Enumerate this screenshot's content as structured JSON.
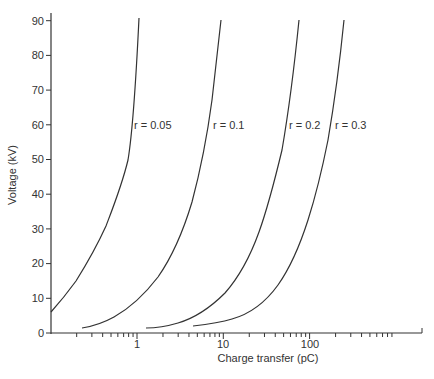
{
  "chart_data": {
    "type": "line",
    "title": "",
    "xlabel": "Charge transfer (pC)",
    "ylabel": "Voltage (kV)",
    "xscale": "log",
    "xlim": [
      0.1,
      2000
    ],
    "ylim": [
      0,
      90
    ],
    "x_tick_labels": [
      "1",
      "10",
      "100"
    ],
    "y_tick_labels": [
      "0",
      "10",
      "20",
      "30",
      "40",
      "50",
      "60",
      "70",
      "80",
      "90"
    ],
    "grid": false,
    "legend": "inline labels",
    "series": [
      {
        "name": "r = 0.05",
        "points": [
          [
            0.1,
            6
          ],
          [
            0.17,
            12
          ],
          [
            0.31,
            22
          ],
          [
            0.5,
            35
          ],
          [
            0.72,
            47
          ],
          [
            0.86,
            60
          ],
          [
            1.02,
            90
          ]
        ]
      },
      {
        "name": "r = 0.1",
        "points": [
          [
            0.24,
            1.5
          ],
          [
            0.51,
            4
          ],
          [
            0.72,
            11.5
          ],
          [
            1.6,
            18
          ],
          [
            3.0,
            30.5
          ],
          [
            4.3,
            39
          ],
          [
            5.4,
            47
          ],
          [
            7.5,
            60
          ],
          [
            8.9,
            90
          ]
        ]
      },
      {
        "name": "r = 0.2",
        "points": [
          [
            1.25,
            1.5
          ],
          [
            2.4,
            2.4
          ],
          [
            6.5,
            6.5
          ],
          [
            13,
            14
          ],
          [
            22,
            25.5
          ],
          [
            32,
            36
          ],
          [
            40,
            47
          ],
          [
            60,
            60
          ],
          [
            72,
            90
          ]
        ]
      },
      {
        "name": "r = 0.3",
        "points": [
          [
            4.3,
            2
          ],
          [
            8.6,
            3.2
          ],
          [
            19,
            8.7
          ],
          [
            35,
            17.3
          ],
          [
            61,
            27.6
          ],
          [
            86,
            38.2
          ],
          [
            108,
            47
          ],
          [
            150,
            60
          ],
          [
            240,
            90
          ]
        ]
      }
    ]
  },
  "labels": {
    "xlabel": "Charge transfer (pC)",
    "ylabel": "Voltage (kV)",
    "curves": [
      "r = 0.05",
      "r = 0.1",
      "r = 0.2",
      "r = 0.3"
    ],
    "xticks": [
      "1",
      "10",
      "100"
    ],
    "yticks": [
      "0",
      "10",
      "20",
      "30",
      "40",
      "50",
      "60",
      "70",
      "80",
      "90"
    ]
  }
}
